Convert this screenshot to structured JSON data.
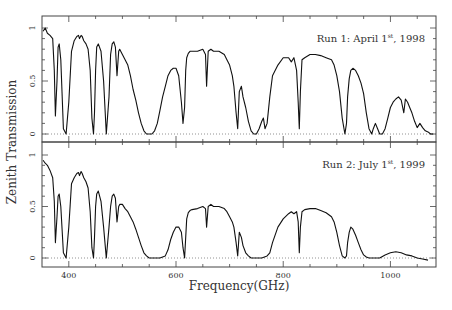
{
  "chart_data": [
    {
      "type": "line",
      "panel": "top",
      "title": "",
      "annotation": {
        "text": "Run 1: April 1",
        "sup": "st",
        "tail": ", 1998"
      },
      "xlabel": "Frequency(GHz)",
      "ylabel": "Zenith Transmission",
      "xlim": [
        350,
        1085
      ],
      "ylim": [
        -0.05,
        1.07
      ],
      "yticks": [
        0,
        0.5,
        1
      ],
      "ytick_labels": [
        "0",
        "0.5",
        "1"
      ],
      "grid": false,
      "zero_line": "dotted",
      "series": [
        {
          "name": "Run 1",
          "x": [
            352,
            356,
            360,
            365,
            370,
            373,
            375,
            378,
            380,
            382,
            385,
            390,
            395,
            400,
            405,
            410,
            415,
            418,
            420,
            423,
            425,
            428,
            432,
            436,
            440,
            443,
            446,
            448,
            450,
            452,
            455,
            460,
            465,
            470,
            475,
            478,
            481,
            484,
            487,
            490,
            493,
            495,
            500,
            505,
            510,
            515,
            520,
            525,
            530,
            535,
            540,
            545,
            550,
            555,
            560,
            565,
            570,
            575,
            580,
            585,
            590,
            595,
            600,
            605,
            610,
            613,
            616,
            618,
            620,
            623,
            626,
            630,
            640,
            650,
            655,
            657,
            660,
            665,
            670,
            680,
            690,
            695,
            700,
            705,
            708,
            712,
            715,
            718,
            722,
            725,
            730,
            735,
            740,
            745,
            750,
            755,
            760,
            763,
            766,
            770,
            775,
            780,
            790,
            800,
            810,
            815,
            820,
            825,
            828,
            830,
            832,
            835,
            840,
            850,
            860,
            870,
            880,
            890,
            895,
            900,
            905,
            910,
            915,
            918,
            920,
            923,
            926,
            930,
            935,
            940,
            945,
            950,
            955,
            960,
            965,
            968,
            972,
            976,
            980,
            985,
            990,
            995,
            1000,
            1005,
            1010,
            1015,
            1020,
            1025,
            1028,
            1032,
            1036,
            1040,
            1045,
            1050,
            1055,
            1060,
            1065,
            1070,
            1075,
            1080
          ],
          "y": [
            0.97,
            1.0,
            0.95,
            0.93,
            0.9,
            0.6,
            0.17,
            0.5,
            0.82,
            0.85,
            0.7,
            0.05,
            0.0,
            0.3,
            0.78,
            0.88,
            0.92,
            0.93,
            0.9,
            0.93,
            0.92,
            0.88,
            0.85,
            0.8,
            0.6,
            0.15,
            0.0,
            0.2,
            0.6,
            0.82,
            0.85,
            0.78,
            0.5,
            0.0,
            0.35,
            0.75,
            0.85,
            0.87,
            0.82,
            0.55,
            0.78,
            0.8,
            0.75,
            0.7,
            0.65,
            0.55,
            0.42,
            0.32,
            0.2,
            0.1,
            0.03,
            0.0,
            0.0,
            0.0,
            0.03,
            0.1,
            0.22,
            0.35,
            0.45,
            0.55,
            0.6,
            0.62,
            0.62,
            0.55,
            0.3,
            0.1,
            0.25,
            0.6,
            0.72,
            0.76,
            0.78,
            0.78,
            0.78,
            0.8,
            0.75,
            0.45,
            0.78,
            0.8,
            0.78,
            0.78,
            0.75,
            0.7,
            0.65,
            0.55,
            0.45,
            0.2,
            0.05,
            0.4,
            0.45,
            0.35,
            0.25,
            0.12,
            0.03,
            0.0,
            0.0,
            0.05,
            0.12,
            0.15,
            0.05,
            0.1,
            0.35,
            0.55,
            0.65,
            0.72,
            0.72,
            0.68,
            0.72,
            0.6,
            0.3,
            0.05,
            0.4,
            0.7,
            0.72,
            0.75,
            0.75,
            0.74,
            0.72,
            0.7,
            0.65,
            0.55,
            0.4,
            0.15,
            0.0,
            0.1,
            0.35,
            0.52,
            0.6,
            0.62,
            0.6,
            0.55,
            0.48,
            0.38,
            0.2,
            0.05,
            0.0,
            0.05,
            0.1,
            0.05,
            0.0,
            0.0,
            0.05,
            0.15,
            0.25,
            0.3,
            0.33,
            0.35,
            0.32,
            0.2,
            0.33,
            0.3,
            0.25,
            0.2,
            0.12,
            0.06,
            0.1,
            0.06,
            0.03,
            0.02,
            0.0,
            0.0
          ]
        }
      ]
    },
    {
      "type": "line",
      "panel": "bottom",
      "title": "",
      "annotation": {
        "text": "Run 2: July 1",
        "sup": "st",
        "tail": ", 1999"
      },
      "xlabel": "Frequency(GHz)",
      "ylabel": "Zenith Transmission",
      "xlim": [
        350,
        1085
      ],
      "ylim": [
        -0.05,
        1.07
      ],
      "xticks": [
        400,
        600,
        800,
        1000
      ],
      "xtick_labels": [
        "400",
        "600",
        "800",
        "1000"
      ],
      "yticks": [
        0,
        0.5,
        1
      ],
      "ytick_labels": [
        "0",
        "0.5",
        "1"
      ],
      "grid": false,
      "zero_line": "dotted",
      "series": [
        {
          "name": "Run 2",
          "x": [
            352,
            356,
            360,
            365,
            370,
            373,
            375,
            378,
            380,
            382,
            385,
            390,
            395,
            400,
            405,
            410,
            415,
            418,
            420,
            423,
            425,
            428,
            432,
            436,
            440,
            443,
            446,
            448,
            450,
            452,
            455,
            460,
            465,
            470,
            475,
            478,
            481,
            484,
            487,
            490,
            493,
            495,
            500,
            505,
            510,
            515,
            520,
            525,
            530,
            535,
            540,
            545,
            550,
            560,
            570,
            580,
            585,
            590,
            595,
            600,
            605,
            610,
            613,
            616,
            618,
            620,
            623,
            626,
            630,
            640,
            650,
            655,
            657,
            660,
            665,
            670,
            680,
            690,
            695,
            700,
            705,
            708,
            712,
            715,
            718,
            722,
            725,
            730,
            735,
            740,
            750,
            760,
            770,
            775,
            780,
            790,
            800,
            810,
            815,
            820,
            825,
            828,
            830,
            832,
            835,
            840,
            850,
            860,
            870,
            880,
            890,
            895,
            900,
            905,
            910,
            915,
            918,
            920,
            923,
            926,
            930,
            935,
            940,
            945,
            950,
            955,
            960,
            965,
            970,
            980,
            990,
            1000,
            1010,
            1020,
            1030,
            1040,
            1050,
            1060,
            1070,
            1080
          ],
          "y": [
            0.95,
            0.92,
            0.9,
            0.85,
            0.78,
            0.55,
            0.15,
            0.4,
            0.6,
            0.62,
            0.5,
            0.05,
            0.0,
            0.3,
            0.72,
            0.78,
            0.82,
            0.83,
            0.8,
            0.84,
            0.82,
            0.78,
            0.74,
            0.68,
            0.45,
            0.1,
            0.0,
            0.2,
            0.5,
            0.62,
            0.65,
            0.55,
            0.3,
            0.0,
            0.3,
            0.5,
            0.6,
            0.62,
            0.58,
            0.35,
            0.5,
            0.52,
            0.52,
            0.48,
            0.45,
            0.4,
            0.35,
            0.28,
            0.2,
            0.12,
            0.05,
            0.02,
            0.0,
            0.0,
            0.0,
            0.02,
            0.08,
            0.18,
            0.25,
            0.3,
            0.3,
            0.25,
            0.1,
            0.0,
            0.2,
            0.38,
            0.44,
            0.46,
            0.47,
            0.48,
            0.5,
            0.48,
            0.3,
            0.5,
            0.52,
            0.5,
            0.5,
            0.48,
            0.45,
            0.4,
            0.35,
            0.3,
            0.15,
            0.02,
            0.25,
            0.2,
            0.12,
            0.05,
            0.02,
            0.0,
            0.0,
            0.0,
            0.02,
            0.05,
            0.15,
            0.3,
            0.38,
            0.43,
            0.45,
            0.43,
            0.45,
            0.35,
            0.05,
            0.3,
            0.45,
            0.47,
            0.48,
            0.48,
            0.46,
            0.44,
            0.4,
            0.35,
            0.25,
            0.12,
            0.02,
            0.0,
            0.02,
            0.15,
            0.25,
            0.3,
            0.28,
            0.22,
            0.15,
            0.08,
            0.03,
            0.01,
            0.0,
            0.0,
            0.0,
            0.0,
            0.03,
            0.05,
            0.06,
            0.05,
            0.03,
            0.02,
            0.0,
            -0.01,
            -0.02
          ]
        }
      ]
    }
  ],
  "axes": {
    "xlabel": "Frequency(GHz)",
    "ylabel": "Zenith Transmission"
  }
}
